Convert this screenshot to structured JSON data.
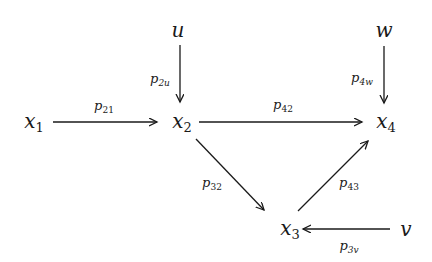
{
  "diagram": {
    "type": "path-diagram",
    "nodes": [
      {
        "id": "u",
        "base": "u",
        "sub": "",
        "x": 178,
        "y": 30
      },
      {
        "id": "w",
        "base": "w",
        "sub": "",
        "x": 384,
        "y": 30
      },
      {
        "id": "x1",
        "base": "x",
        "sub": "1",
        "x": 34,
        "y": 122
      },
      {
        "id": "x2",
        "base": "x",
        "sub": "2",
        "x": 182,
        "y": 122
      },
      {
        "id": "x4",
        "base": "x",
        "sub": "4",
        "x": 386,
        "y": 122
      },
      {
        "id": "x3",
        "base": "x",
        "sub": "3",
        "x": 290,
        "y": 229
      },
      {
        "id": "v",
        "base": "v",
        "sub": "",
        "x": 406,
        "y": 229
      }
    ],
    "edges": [
      {
        "from": "x1",
        "to": "x2",
        "label_base": "p",
        "label_sub": "21"
      },
      {
        "from": "u",
        "to": "x2",
        "label_base": "p",
        "label_sub": "2u"
      },
      {
        "from": "x2",
        "to": "x4",
        "label_base": "p",
        "label_sub": "42"
      },
      {
        "from": "w",
        "to": "x4",
        "label_base": "p",
        "label_sub": "4w"
      },
      {
        "from": "x2",
        "to": "x3",
        "label_base": "p",
        "label_sub": "32"
      },
      {
        "from": "x3",
        "to": "x4",
        "label_base": "p",
        "label_sub": "43"
      },
      {
        "from": "v",
        "to": "x3",
        "label_base": "p",
        "label_sub": "3v"
      }
    ]
  },
  "colors": {
    "stroke": "#1a1a1a",
    "background": "#ffffff"
  }
}
